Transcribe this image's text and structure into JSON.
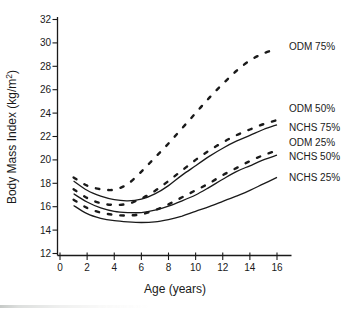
{
  "figure": {
    "background": "#ffffff",
    "ink_color": "#1a1a1a"
  },
  "chart_data": {
    "type": "line",
    "title": "",
    "xlabel": "Age (years)",
    "ylabel": "Body Mass Index (kg/m2)",
    "ylabel_parts": {
      "prefix": "Body Mass Index (kg/m",
      "superscript": "2",
      "suffix": ")"
    },
    "x": [
      1,
      2,
      3,
      4,
      5,
      6,
      7,
      8,
      9,
      10,
      11,
      12,
      13,
      14,
      15,
      16
    ],
    "xlim": [
      0,
      17
    ],
    "ylim": [
      12,
      32
    ],
    "xticks": [
      0,
      2,
      4,
      6,
      8,
      10,
      12,
      14,
      16
    ],
    "yticks": [
      12,
      14,
      16,
      18,
      20,
      22,
      24,
      26,
      28,
      30,
      32
    ],
    "grid": false,
    "legend_position": "inline-right-of-curves",
    "series": [
      {
        "name": "ODM 75%",
        "line_style": "dashed",
        "label_y_px": 46,
        "values": [
          18.5,
          17.8,
          17.5,
          17.45,
          17.95,
          19.0,
          20.2,
          21.4,
          22.7,
          24.0,
          25.3,
          26.5,
          27.6,
          28.5,
          29.1,
          29.5
        ]
      },
      {
        "name": "ODM 50%",
        "line_style": "dashed",
        "label_y_px": 108,
        "values": [
          17.5,
          16.75,
          16.3,
          16.15,
          16.25,
          16.7,
          17.35,
          18.2,
          19.1,
          20.0,
          20.8,
          21.5,
          22.1,
          22.6,
          23.05,
          23.4
        ]
      },
      {
        "name": "NCHS 75%",
        "line_style": "solid",
        "label_y_px": 127,
        "values": [
          18.2,
          17.4,
          16.9,
          16.6,
          16.5,
          16.65,
          17.1,
          17.8,
          18.7,
          19.5,
          20.3,
          21.0,
          21.6,
          22.1,
          22.6,
          23.0
        ]
      },
      {
        "name": "ODM 25%",
        "line_style": "dashed",
        "label_y_px": 142,
        "values": [
          16.6,
          15.9,
          15.5,
          15.3,
          15.25,
          15.35,
          15.7,
          16.2,
          16.8,
          17.4,
          18.0,
          18.7,
          19.3,
          19.9,
          20.4,
          20.8
        ]
      },
      {
        "name": "NCHS 50%",
        "line_style": "solid",
        "label_y_px": 156,
        "values": [
          17.1,
          16.4,
          15.9,
          15.6,
          15.5,
          15.5,
          15.7,
          16.05,
          16.5,
          17.0,
          17.65,
          18.35,
          19.0,
          19.5,
          20.0,
          20.4
        ]
      },
      {
        "name": "NCHS 25%",
        "line_style": "solid",
        "label_y_px": 177,
        "values": [
          16.1,
          15.4,
          15.0,
          14.8,
          14.7,
          14.65,
          14.7,
          14.9,
          15.2,
          15.6,
          16.0,
          16.45,
          16.9,
          17.4,
          17.95,
          18.5
        ]
      }
    ]
  }
}
